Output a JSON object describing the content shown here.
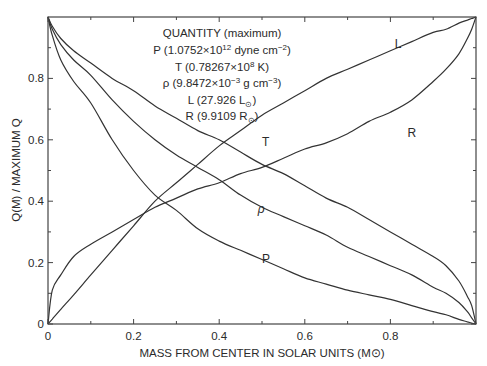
{
  "chart_data": {
    "type": "line",
    "title": "",
    "xlabel": "MASS FROM CENTER IN SOLAR UNITS (M⊙)",
    "ylabel": "Q(M) / MAXIMUM Q",
    "xlim": [
      0,
      1
    ],
    "ylim": [
      0,
      1
    ],
    "grid": false,
    "x_ticks": [
      0,
      0.2,
      0.4,
      0.6,
      0.8
    ],
    "x_tick_labels": [
      "0",
      "0.2",
      "0.4",
      "0.6",
      "0.8"
    ],
    "x_minor_ticks": [
      0.1,
      0.3,
      0.5,
      0.7,
      0.9
    ],
    "y_ticks": [
      0,
      0.2,
      0.4,
      0.6,
      0.8
    ],
    "y_tick_labels": [
      "0",
      "0.2",
      "0.4",
      "0.6",
      "0.8"
    ],
    "y_minor_ticks": [
      0.1,
      0.3,
      0.5,
      0.7,
      0.9
    ],
    "annotation": {
      "heading": "QUANTITY (maximum)",
      "lines": [
        {
          "sym": "P",
          "text": "P (1.0752×10",
          "sup": "12",
          "tail": " dyne cm",
          "sup2": "−2",
          "end": ")"
        },
        {
          "sym": "T",
          "text": "T (0.78267×10",
          "sup": "8",
          "tail": " K)",
          "sup2": "",
          "end": ""
        },
        {
          "sym": "ρ",
          "text": "ρ (9.8472×10",
          "sup": "−3",
          "tail": " g cm",
          "sup2": "−3",
          "end": ")"
        },
        {
          "sym": "L",
          "text": "L (27.926 L",
          "sub": "⊙",
          "end": ")"
        },
        {
          "sym": "R",
          "text": "R (9.9109 R",
          "sub": "⊙",
          "end": ")"
        }
      ]
    },
    "x": [
      0,
      0.01,
      0.03,
      0.06,
      0.1,
      0.15,
      0.2,
      0.25,
      0.3,
      0.35,
      0.4,
      0.45,
      0.5,
      0.55,
      0.6,
      0.65,
      0.7,
      0.75,
      0.8,
      0.85,
      0.9,
      0.93,
      0.96,
      0.98,
      0.99,
      1.0
    ],
    "series": [
      {
        "name": "P",
        "label": "P",
        "label_pos": [
          0.5,
          0.2
        ],
        "values": [
          1.0,
          0.94,
          0.86,
          0.79,
          0.72,
          0.6,
          0.5,
          0.42,
          0.37,
          0.31,
          0.27,
          0.24,
          0.21,
          0.18,
          0.15,
          0.13,
          0.11,
          0.095,
          0.08,
          0.06,
          0.04,
          0.03,
          0.015,
          0.007,
          0.003,
          0.0
        ]
      },
      {
        "name": "T",
        "label": "T",
        "label_pos": [
          0.5,
          0.58
        ],
        "values": [
          1.0,
          0.97,
          0.93,
          0.89,
          0.85,
          0.8,
          0.76,
          0.71,
          0.67,
          0.63,
          0.6,
          0.56,
          0.52,
          0.49,
          0.45,
          0.41,
          0.38,
          0.34,
          0.3,
          0.26,
          0.22,
          0.19,
          0.14,
          0.09,
          0.06,
          0.0
        ]
      },
      {
        "name": "rho",
        "label": "ρ",
        "label_pos": [
          0.49,
          0.36
        ],
        "values": [
          1.0,
          0.96,
          0.91,
          0.86,
          0.81,
          0.73,
          0.66,
          0.6,
          0.55,
          0.51,
          0.47,
          0.42,
          0.38,
          0.35,
          0.32,
          0.29,
          0.25,
          0.22,
          0.19,
          0.16,
          0.12,
          0.1,
          0.07,
          0.04,
          0.02,
          0.0
        ]
      },
      {
        "name": "L",
        "label": "L",
        "label_pos": [
          0.81,
          0.9
        ],
        "values": [
          0.0,
          0.016,
          0.048,
          0.095,
          0.16,
          0.24,
          0.32,
          0.4,
          0.46,
          0.52,
          0.58,
          0.63,
          0.68,
          0.72,
          0.76,
          0.8,
          0.83,
          0.86,
          0.89,
          0.92,
          0.95,
          0.96,
          0.98,
          0.99,
          0.995,
          1.0
        ]
      },
      {
        "name": "R",
        "label": "R",
        "label_pos": [
          0.84,
          0.61
        ],
        "values": [
          0.0,
          0.11,
          0.16,
          0.22,
          0.26,
          0.3,
          0.34,
          0.38,
          0.41,
          0.44,
          0.46,
          0.49,
          0.51,
          0.54,
          0.57,
          0.59,
          0.62,
          0.66,
          0.69,
          0.73,
          0.79,
          0.83,
          0.88,
          0.93,
          0.96,
          1.0
        ]
      }
    ]
  }
}
